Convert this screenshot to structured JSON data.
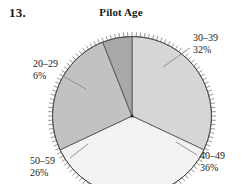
{
  "problem": {
    "number": "13."
  },
  "chart_data": {
    "type": "pie",
    "title": "Pilot Age",
    "xlabel": "",
    "ylabel": "",
    "grid": false,
    "legend_position": "callout-labels",
    "categories": [
      "30–39",
      "40–49",
      "50–59",
      "20–29"
    ],
    "values": [
      32,
      36,
      26,
      6
    ],
    "value_labels": [
      "32%",
      "36%",
      "26%",
      "6%"
    ],
    "units": "percent",
    "total": 100,
    "start_angle_deg": 0,
    "direction": "clockwise",
    "rim_ticks": 120,
    "slices": [
      {
        "label": "30–39",
        "percent_text": "32%",
        "value": 32,
        "color": "#d6d6d6",
        "start_deg": 0,
        "end_deg": 115.2
      },
      {
        "label": "40–49",
        "percent_text": "36%",
        "value": 36,
        "color": "#f2f2f2",
        "start_deg": 115.2,
        "end_deg": 244.8
      },
      {
        "label": "50–59",
        "percent_text": "26%",
        "value": 26,
        "color": "#c2c2c2",
        "start_deg": 244.8,
        "end_deg": 338.4
      },
      {
        "label": "20–29",
        "percent_text": "6%",
        "value": 6,
        "color": "#a8a8a8",
        "start_deg": 338.4,
        "end_deg": 360
      }
    ]
  },
  "labels": {
    "age_30_39": {
      "range": "30–39",
      "percent": "32%"
    },
    "age_40_49": {
      "range": "40–49",
      "percent": "36%"
    },
    "age_50_59": {
      "range": "50–59",
      "percent": "26%"
    },
    "age_20_29": {
      "range": "20–29",
      "percent": "6%"
    }
  },
  "colors": {
    "slice_30_39": "#d6d6d6",
    "slice_40_49": "#f2f2f2",
    "slice_50_59": "#c2c2c2",
    "slice_20_29": "#a8a8a8",
    "outline": "#4a4a4a",
    "leader_line": "#8a8a8a",
    "text": "#1a1a1a",
    "background": "#ffffff"
  }
}
